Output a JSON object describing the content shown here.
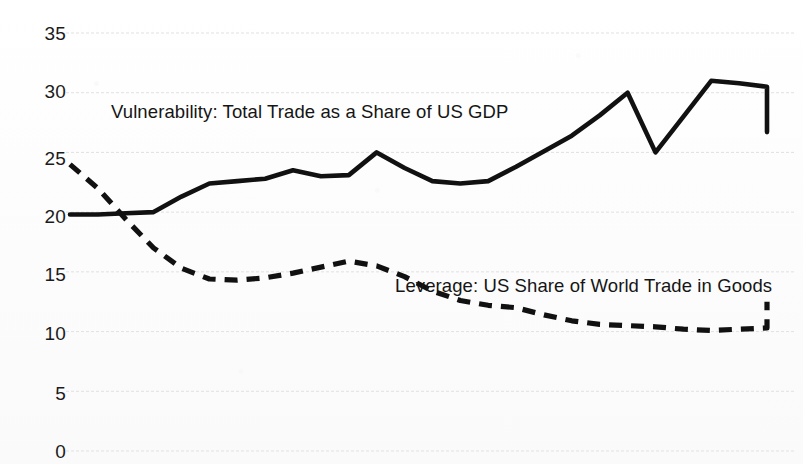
{
  "chart_data": {
    "type": "line",
    "title": "",
    "subtitle": "",
    "xlabel": "",
    "ylabel": "",
    "ylim": [
      0,
      35
    ],
    "xlim": [
      1960,
      2010
    ],
    "ytick_labels": [
      "35",
      "30",
      "25",
      "20",
      "15",
      "10",
      "5",
      "0"
    ],
    "yticks": [
      35,
      30,
      25,
      20,
      15,
      10,
      5,
      0
    ],
    "grid": true,
    "grid_axis": "y",
    "legend_position": "inline-annotations",
    "xtick_labels": [],
    "x": [
      0,
      1,
      2,
      3,
      4,
      5,
      6,
      7,
      8,
      9,
      10,
      11,
      12,
      13,
      14,
      15,
      16,
      17,
      18,
      19,
      20,
      21,
      22,
      23,
      24,
      25
    ],
    "series": [
      {
        "name": "Vulnerability: Total Trade as a Share of US GDP",
        "style": "solid",
        "color": "#111111",
        "values": [
          19.8,
          19.8,
          19.9,
          20.0,
          21.3,
          22.4,
          22.6,
          22.8,
          23.5,
          23.0,
          23.1,
          25.0,
          23.7,
          22.6,
          22.4,
          22.6,
          23.8,
          25.1,
          26.4,
          28.1,
          30.0,
          25.0,
          28.0,
          31.0,
          30.8,
          30.5
        ]
      },
      {
        "name": "Leverage: US Share of World Trade in Goods",
        "style": "dashed",
        "color": "#111111",
        "values": [
          24.0,
          22.0,
          19.4,
          17.0,
          15.3,
          14.4,
          14.3,
          14.5,
          14.9,
          15.4,
          15.9,
          15.5,
          14.6,
          13.4,
          12.6,
          12.2,
          12.0,
          11.4,
          10.9,
          10.6,
          10.5,
          10.4,
          10.2,
          10.1,
          10.2,
          10.3
        ]
      }
    ],
    "annotations": [
      {
        "id": "vulnerability-label",
        "text": "Vulnerability: Total Trade as a Share of US GDP",
        "x_px": 111,
        "y_px": 103
      },
      {
        "id": "leverage-label",
        "text": "Leverage: US Share of World Trade in Goods",
        "x_px": 395,
        "y_px": 277
      }
    ],
    "tail": {
      "solid_end_value": 26.7,
      "dashed_end_value": 12.5
    }
  },
  "axis": {
    "ticks": [
      {
        "label": "35",
        "y_px": 24
      },
      {
        "label": "30",
        "y_px": 82
      },
      {
        "label": "25",
        "y_px": 149
      },
      {
        "label": "20",
        "y_px": 207
      },
      {
        "label": "15",
        "y_px": 265
      },
      {
        "label": "10",
        "y_px": 324
      },
      {
        "label": "5",
        "y_px": 384
      },
      {
        "label": "0",
        "y_px": 442
      }
    ]
  },
  "colors": {
    "ink": "#111111",
    "grid": "#d9d9d9",
    "paper": "#fdfdfd"
  }
}
